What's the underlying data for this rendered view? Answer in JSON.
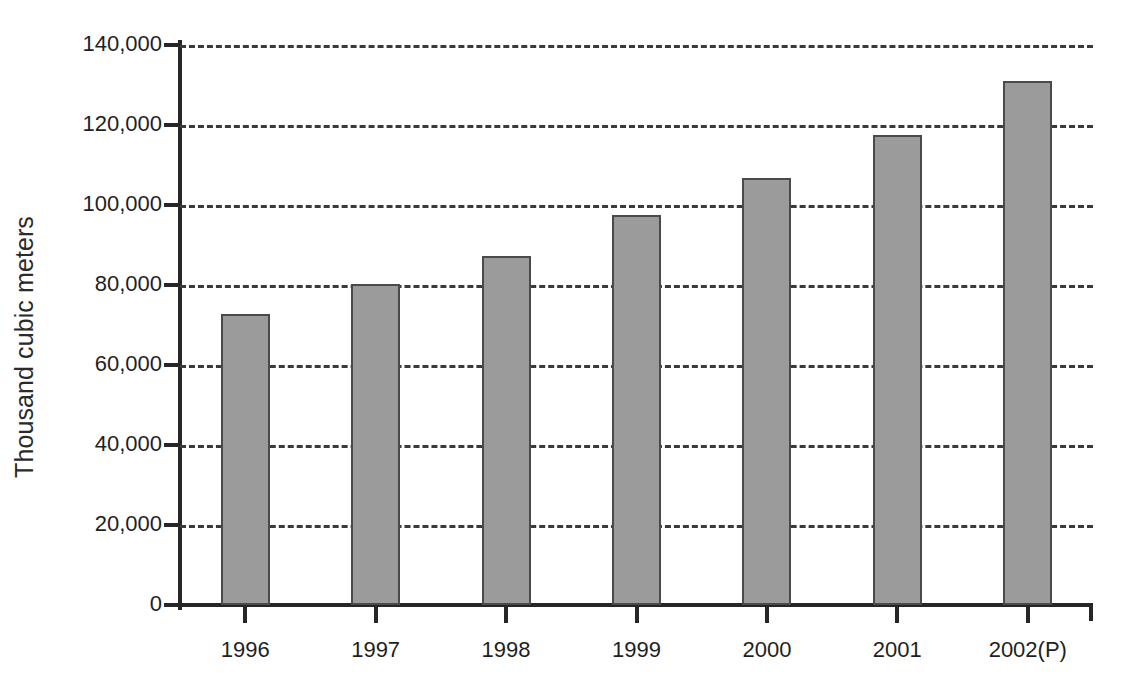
{
  "chart_data": {
    "type": "bar",
    "title": "",
    "xlabel": "",
    "ylabel": "Thousand cubic meters",
    "categories": [
      "1996",
      "1997",
      "1998",
      "1999",
      "2000",
      "2001",
      "2002(P)"
    ],
    "values": [
      72800,
      80200,
      87300,
      97400,
      106800,
      117400,
      131000
    ],
    "ylim": [
      0,
      140000
    ],
    "yticks": [
      0,
      20000,
      40000,
      60000,
      80000,
      100000,
      120000,
      140000
    ],
    "ytick_labels": [
      "0",
      "20,000",
      "40,000",
      "60,000",
      "80,000",
      "100,000",
      "120,000",
      "140,000"
    ],
    "grid": "horizontal-dashed",
    "legend": "none",
    "bar_color": "#9b9b9b",
    "bar_border_color": "#4a4a4a",
    "axis_color": "#262626",
    "gridline_color": "#3a3a3a"
  },
  "axes": {
    "y_title": "Thousand cubic meters"
  }
}
